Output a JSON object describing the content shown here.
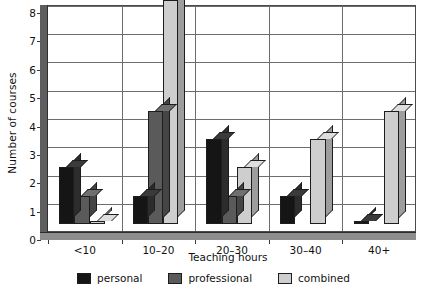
{
  "chart_data": {
    "type": "bar",
    "title": "",
    "subtitle": "",
    "xlabel": "Teaching hours",
    "ylabel": "Number of courses",
    "categories": [
      "<10",
      "10–20",
      "20–30",
      "30–40",
      "40+"
    ],
    "series": [
      {
        "name": "personal",
        "color": "#151515",
        "values": [
          2,
          1,
          3,
          1,
          0.1
        ]
      },
      {
        "name": "professional",
        "color": "#5a5a5a",
        "values": [
          1,
          4,
          1,
          0,
          0
        ]
      },
      {
        "name": "combined",
        "color": "#cecece",
        "values": [
          0.1,
          7.9,
          2,
          3,
          4
        ]
      }
    ],
    "ylim": [
      0,
      8
    ],
    "yticks": [
      0,
      1,
      2,
      3,
      4,
      5,
      6,
      7,
      8
    ],
    "ytick_labels": [
      "0",
      "1",
      "2",
      "3",
      "4",
      "5",
      "6",
      "7",
      "8"
    ],
    "grid": true,
    "grid_axis": "y",
    "legend_position": "bottom",
    "style": "3d-columns",
    "annotations": []
  },
  "legend": {
    "items": [
      {
        "label": "personal",
        "swatch": "black-swatch"
      },
      {
        "label": "professional",
        "swatch": "dark-gray-swatch"
      },
      {
        "label": "combined",
        "swatch": "light-gray-swatch"
      }
    ]
  }
}
